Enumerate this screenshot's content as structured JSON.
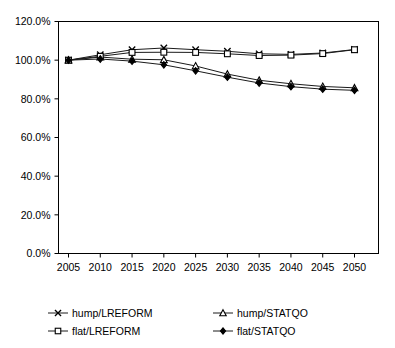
{
  "chart_data": {
    "type": "line",
    "title": "",
    "subtitle": "",
    "xlabel": "",
    "ylabel": "",
    "grid": false,
    "legend_position": "bottom",
    "x": [
      2005,
      2010,
      2015,
      2020,
      2025,
      2030,
      2035,
      2040,
      2045,
      2050
    ],
    "xtick_labels": [
      "2005",
      "2010",
      "2015",
      "2020",
      "2025",
      "2030",
      "2035",
      "2040",
      "2045",
      "2050"
    ],
    "ytick_labels": [
      "0.0%",
      "20.0%",
      "40.0%",
      "60.0%",
      "80.0%",
      "100.0%",
      "120.0%"
    ],
    "ytick_values": [
      0,
      20,
      40,
      60,
      80,
      100,
      120
    ],
    "ylim": [
      0,
      120
    ],
    "xlim": [
      2005,
      2050
    ],
    "series": [
      {
        "name": "hump/LREFORM",
        "marker": "cross",
        "values": [
          100.0,
          102.8,
          105.4,
          106.3,
          105.4,
          104.6,
          103.3,
          103.0,
          103.7,
          105.5
        ]
      },
      {
        "name": "hump/STATQO",
        "marker": "triangle-open",
        "values": [
          100.0,
          101.6,
          100.5,
          100.2,
          97.0,
          92.8,
          89.6,
          87.8,
          86.4,
          85.7
        ]
      },
      {
        "name": "flat/LREFORM",
        "marker": "square-open",
        "values": [
          100.0,
          102.0,
          104.0,
          104.1,
          104.0,
          103.3,
          102.4,
          102.6,
          103.4,
          105.4
        ]
      },
      {
        "name": "flat/STATQO",
        "marker": "diamond-filled",
        "values": [
          100.0,
          100.6,
          99.5,
          97.6,
          94.5,
          91.2,
          88.2,
          86.3,
          85.0,
          84.4
        ]
      }
    ]
  },
  "legend": {
    "entries": [
      {
        "label": "hump/LREFORM",
        "marker": "cross"
      },
      {
        "label": "hump/STATQO",
        "marker": "triangle-open"
      },
      {
        "label": "flat/LREFORM",
        "marker": "square-open"
      },
      {
        "label": "flat/STATQO",
        "marker": "diamond-filled"
      }
    ]
  }
}
